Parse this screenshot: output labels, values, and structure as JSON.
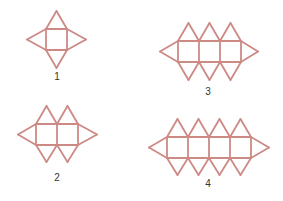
{
  "stick_color": "#cd8a85",
  "figures": [
    {
      "label": "1",
      "squares": 1,
      "x0": 46,
      "y0": 29,
      "side": 21,
      "apex_top": 11,
      "apex_bottom": 68,
      "apex_left": 27,
      "apex_right": 86,
      "label_x": 57,
      "label_y": 77
    },
    {
      "label": "2",
      "squares": 2,
      "x0": 36,
      "y0": 124,
      "side": 21,
      "apex_top": 106,
      "apex_bottom": 162,
      "apex_left": 18,
      "apex_right": 97,
      "label_x": 57,
      "label_y": 178
    },
    {
      "label": "3",
      "squares": 3,
      "x0": 178,
      "y0": 41,
      "side": 21,
      "apex_top": 23,
      "apex_bottom": 80,
      "apex_left": 160,
      "apex_right": 258,
      "label_x": 208,
      "label_y": 92
    },
    {
      "label": "4",
      "squares": 4,
      "x0": 167,
      "y0": 137,
      "side": 21,
      "apex_top": 119,
      "apex_bottom": 175,
      "apex_left": 149,
      "apex_right": 269,
      "label_x": 208,
      "label_y": 184
    }
  ]
}
